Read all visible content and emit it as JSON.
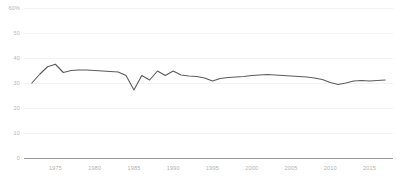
{
  "chart_data": {
    "type": "line",
    "title": "",
    "subtitle": "",
    "xlabel": "",
    "ylabel": "",
    "xlim": [
      1971,
      2018
    ],
    "ylim": [
      0,
      60
    ],
    "grid": true,
    "grid_axis": "y",
    "legend": false,
    "legend_position": "none",
    "line_color": "#5b5b5b",
    "axis_color": "#9a9a9a",
    "grid_color": "#f2f2f2",
    "tick_label_color": "#b4b4b4",
    "y_ticks": [
      0,
      10,
      20,
      30,
      40,
      50,
      60
    ],
    "y_tick_labels": [
      "0",
      "10",
      "20",
      "30",
      "40",
      "50",
      "60%"
    ],
    "x_ticks": [
      1975,
      1980,
      1985,
      1990,
      1995,
      2000,
      2005,
      2010,
      2015
    ],
    "x_tick_labels": [
      "1975",
      "1980",
      "1985",
      "1990",
      "1995",
      "2000",
      "2005",
      "2010",
      "2015"
    ],
    "series": [
      {
        "name": "series-1",
        "color": "#5b5b5b",
        "x": [
          1972,
          1973,
          1974,
          1975,
          1976,
          1977,
          1978,
          1979,
          1980,
          1981,
          1982,
          1983,
          1984,
          1985,
          1986,
          1987,
          1988,
          1989,
          1990,
          1991,
          1992,
          1993,
          1994,
          1995,
          1996,
          1997,
          1998,
          1999,
          2000,
          2001,
          2002,
          2003,
          2004,
          2005,
          2006,
          2007,
          2008,
          2009,
          2010,
          2011,
          2012,
          2013,
          2014,
          2015,
          2016,
          2017
        ],
        "values": [
          30.0,
          33.5,
          36.5,
          37.5,
          34.2,
          35.0,
          35.2,
          35.2,
          35.0,
          34.8,
          34.6,
          34.4,
          33.0,
          27.2,
          33.0,
          31.2,
          34.8,
          33.0,
          34.8,
          33.2,
          32.8,
          32.6,
          32.0,
          30.8,
          31.8,
          32.2,
          32.4,
          32.6,
          33.0,
          33.2,
          33.4,
          33.2,
          33.0,
          32.8,
          32.6,
          32.4,
          32.0,
          31.4,
          30.2,
          29.4,
          30.0,
          30.8,
          31.0,
          30.8,
          31.0,
          31.2
        ]
      }
    ]
  }
}
